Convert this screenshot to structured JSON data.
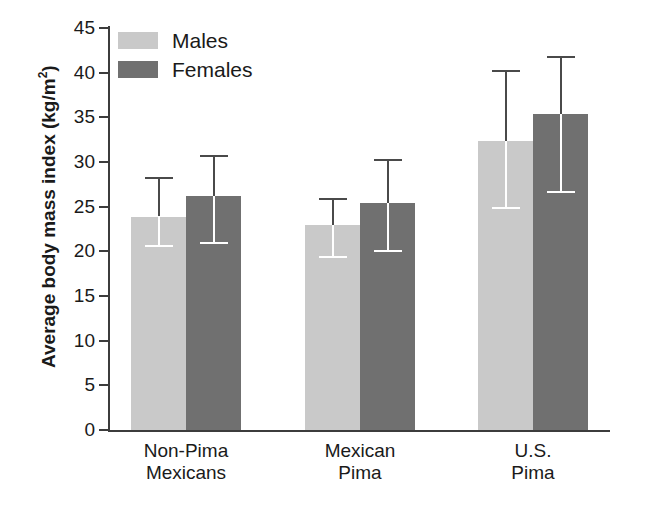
{
  "figure": {
    "top_cropped_text": "",
    "background_color": "#ffffff"
  },
  "legend": {
    "position": "top-left-inside",
    "entries": [
      {
        "label": "Males",
        "color": "#c9c9c9"
      },
      {
        "label": "Females",
        "color": "#707070"
      }
    ]
  },
  "axes": {
    "ylabel": "Average body mass index (kg/m",
    "ylabel_superscript": "2",
    "ylabel_suffix": ")",
    "yticks": [
      0,
      5,
      10,
      15,
      20,
      25,
      30,
      35,
      40,
      45
    ],
    "ytick_labels": [
      "0",
      "5",
      "10",
      "15",
      "20",
      "25",
      "30",
      "35",
      "40",
      "45"
    ],
    "ylim": [
      0,
      45
    ],
    "xlabel": "",
    "grid": false
  },
  "chart_data": {
    "type": "bar",
    "title": "",
    "xlabel": "",
    "ylabel": "Average body mass index (kg/m2)",
    "ylim": [
      0,
      45
    ],
    "grid": false,
    "legend_position": "top-left",
    "error_bars": "vertical whisker with caps (standard deviation)",
    "categories": [
      "Non-Pima Mexicans",
      "Mexican Pima",
      "U.S. Pima"
    ],
    "category_lines": [
      [
        "Non-Pima",
        "Mexicans"
      ],
      [
        "Mexican",
        "Pima"
      ],
      [
        "U.S.",
        "Pima"
      ]
    ],
    "series": [
      {
        "name": "Males",
        "color": "#c9c9c9",
        "values": [
          23.9,
          22.9,
          32.3
        ],
        "err_low": [
          20.7,
          19.5,
          25.0
        ],
        "err_high": [
          28.3,
          26.0,
          40.3
        ]
      },
      {
        "name": "Females",
        "color": "#707070",
        "values": [
          26.2,
          25.4,
          35.4
        ],
        "err_low": [
          21.0,
          20.2,
          26.7
        ],
        "err_high": [
          30.8,
          30.3,
          41.9
        ]
      }
    ]
  }
}
